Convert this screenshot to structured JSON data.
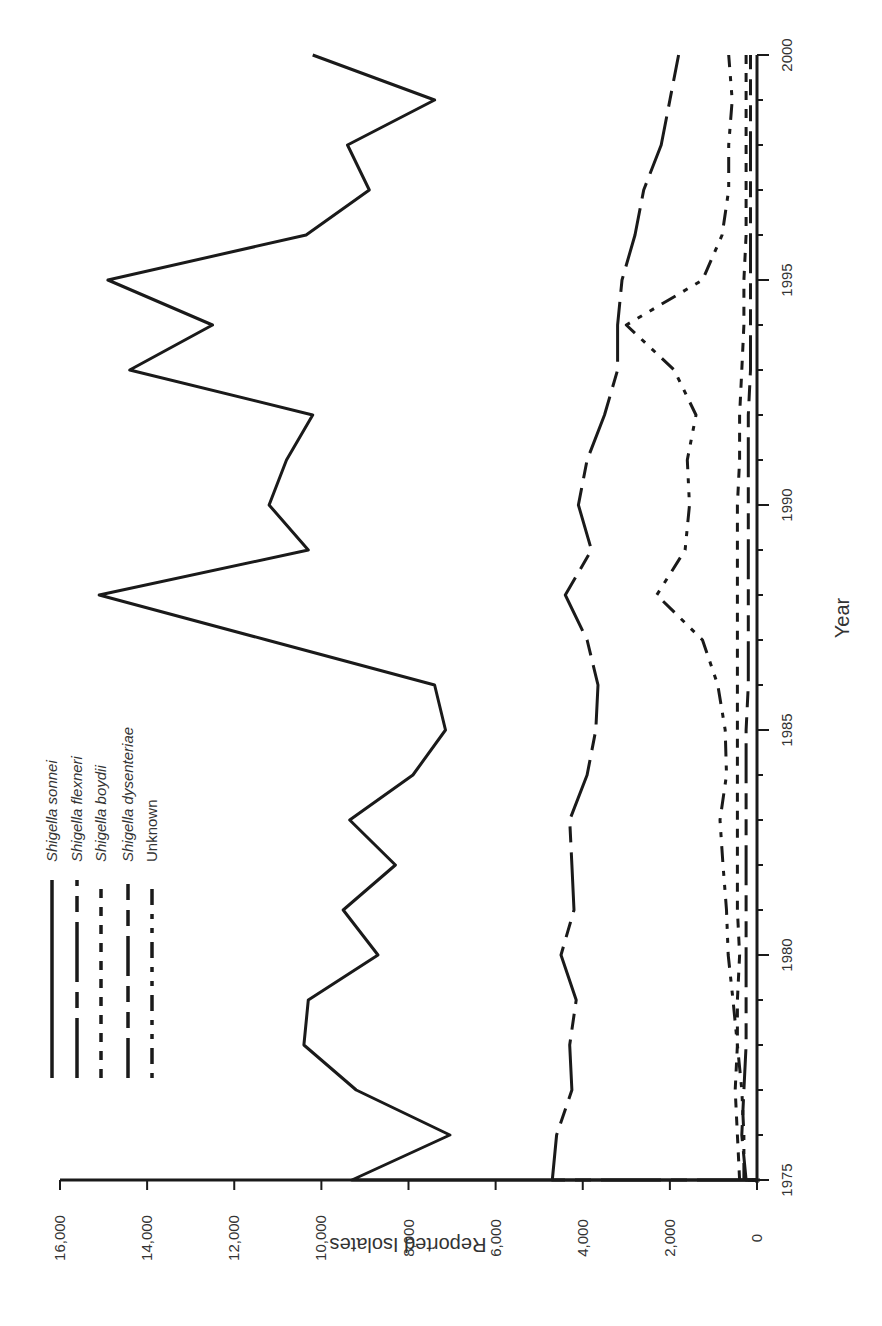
{
  "chart_data": {
    "type": "line",
    "title": "",
    "orientation": "rotated-90-clockwise",
    "xlabel": "Year",
    "ylabel": "Reported Isolates",
    "xlim": [
      1975,
      2000
    ],
    "ylim": [
      0,
      16000
    ],
    "x_ticks": [
      1975,
      1980,
      1985,
      1990,
      1995,
      2000
    ],
    "x_tick_labels": [
      "1975",
      "1980",
      "1985",
      "1990",
      "1995",
      "2000"
    ],
    "y_ticks": [
      0,
      2000,
      4000,
      6000,
      8000,
      10000,
      12000,
      14000,
      16000
    ],
    "y_tick_labels": [
      "0",
      "2,000",
      "4,000",
      "6,000",
      "8,000",
      "10,000",
      "12,000",
      "14,000",
      "16,000"
    ],
    "grid": false,
    "legend_position": "upper-left (rotated)",
    "x": [
      1975,
      1976,
      1977,
      1978,
      1979,
      1980,
      1981,
      1982,
      1983,
      1984,
      1985,
      1986,
      1987,
      1988,
      1989,
      1990,
      1991,
      1992,
      1993,
      1994,
      1995,
      1996,
      1997,
      1998,
      1999,
      2000
    ],
    "series": [
      {
        "name": "Shigella sonnei",
        "style": "solid",
        "values": [
          9300,
          7050,
          9200,
          10400,
          10300,
          8700,
          9500,
          8300,
          9350,
          7900,
          7150,
          7400,
          11250,
          15100,
          10300,
          11200,
          10800,
          10200,
          14400,
          12500,
          14900,
          10350,
          8900,
          9400,
          7400,
          10200
        ]
      },
      {
        "name": "Shigella flexneri",
        "style": "long-dash-short-dash",
        "values": [
          4700,
          4600,
          4250,
          4300,
          4150,
          4500,
          4200,
          4250,
          4300,
          3900,
          3700,
          3650,
          3900,
          4400,
          3800,
          4100,
          3900,
          3500,
          3200,
          3200,
          3100,
          2800,
          2600,
          2200,
          2000,
          1800
        ]
      },
      {
        "name": "Shigella boydii",
        "style": "short-dash",
        "values": [
          400,
          450,
          500,
          450,
          450,
          400,
          450,
          450,
          450,
          450,
          450,
          450,
          450,
          450,
          450,
          450,
          400,
          400,
          350,
          300,
          300,
          250,
          250,
          250,
          250,
          250
        ]
      },
      {
        "name": "Shigella dysenteriae",
        "style": "long-dash-mid-dash",
        "values": [
          250,
          350,
          300,
          250,
          250,
          250,
          250,
          250,
          250,
          250,
          250,
          200,
          200,
          200,
          200,
          200,
          200,
          200,
          150,
          150,
          150,
          150,
          150,
          150,
          150,
          150
        ]
      },
      {
        "name": "Unknown",
        "style": "dash-dot",
        "values": [
          300,
          300,
          350,
          450,
          550,
          660,
          700,
          780,
          850,
          700,
          730,
          900,
          1250,
          2300,
          1650,
          1550,
          1600,
          1400,
          1900,
          3000,
          1250,
          800,
          650,
          650,
          570,
          650
        ]
      }
    ]
  },
  "legend": {
    "items": [
      {
        "label": "Shigella sonnei",
        "italic": true
      },
      {
        "label": "Shigella flexneri",
        "italic": true
      },
      {
        "label": "Shigella boydii",
        "italic": true
      },
      {
        "label": "Shigella dysenteriae",
        "italic": true
      },
      {
        "label": "Unknown",
        "italic": false
      }
    ]
  },
  "colors": {
    "line": "#1a1a1a",
    "text": "#333333",
    "background": "#ffffff"
  }
}
